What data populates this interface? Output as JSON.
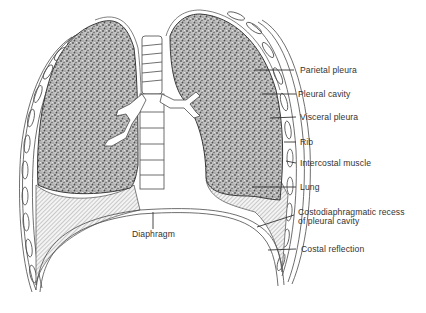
{
  "figure": {
    "labels": {
      "parietal_pleura": "Parietal pleura",
      "pleural_cavity": "Pleural cavity",
      "visceral_pleura": "Visceral pleura",
      "rib": "Rib",
      "intercostal_muscle": "Intercostal muscle",
      "lung": "Lung",
      "costodiaphragmatic_recess_line1": "Costodiaphragmatic recess",
      "costodiaphragmatic_recess_line2": "of pleural cavity",
      "costal_reflection": "Costal reflection",
      "diaphragm": "Diaphragm"
    },
    "colors": {
      "line": "#4a4a4a",
      "lung_fill": "#8a8a8a",
      "text": "#333333",
      "background": "#ffffff"
    }
  }
}
